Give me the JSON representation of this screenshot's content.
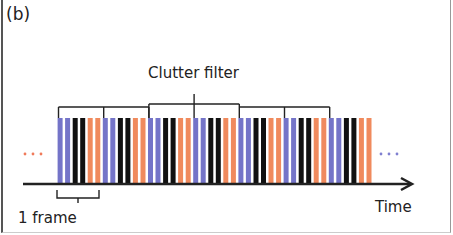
{
  "panel_label": "(b)",
  "clutter_filter_label": "Clutter filter",
  "frame_label": "1 frame",
  "time_label": "Time",
  "num_frames": 7,
  "frame_pattern": [
    "blue",
    "blue",
    "black",
    "black",
    "orange",
    "orange"
  ],
  "colors": {
    "blue": "#7474c8",
    "black": "#111111",
    "orange": "#f08a5d",
    "axis": "#222222",
    "bracket": "#222222",
    "dots_left": "#f07a5a",
    "dots_right": "#8080d0"
  },
  "ellipsis_left": "...",
  "ellipsis_right": "..."
}
